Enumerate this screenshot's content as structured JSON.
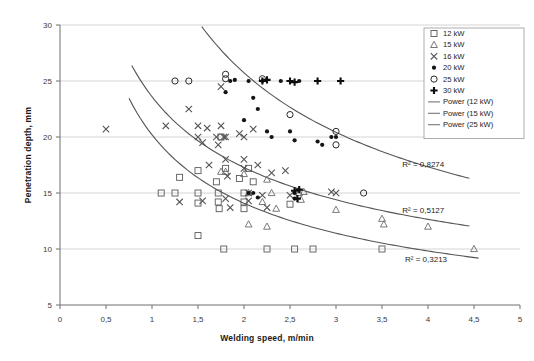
{
  "chart_data": {
    "type": "scatter",
    "title": "",
    "xlabel": "Welding speed, m/min",
    "ylabel": "Penetration depth, mm",
    "xlim": [
      0,
      5
    ],
    "ylim": [
      5,
      30
    ],
    "xticks": [
      "0",
      "0,5",
      "1",
      "1,5",
      "2",
      "2,5",
      "3",
      "3,5",
      "4",
      "4,5",
      "5"
    ],
    "xtick_values": [
      0,
      0.5,
      1,
      1.5,
      2,
      2.5,
      3,
      3.5,
      4,
      4.5,
      5
    ],
    "yticks": [
      "5",
      "10",
      "15",
      "20",
      "25",
      "30"
    ],
    "ytick_values": [
      5,
      10,
      15,
      20,
      25,
      30
    ],
    "grid": "horizontal-major",
    "decimal_separator": ",",
    "legend_position": "top-right",
    "legend": [
      {
        "label": "12 kW",
        "marker": "open-square"
      },
      {
        "label": "15 kW",
        "marker": "open-triangle"
      },
      {
        "label": "16 kW",
        "marker": "cross"
      },
      {
        "label": "20 kW",
        "marker": "filled-circle-small"
      },
      {
        "label": "25 kW",
        "marker": "open-circle"
      },
      {
        "label": "30 kW",
        "marker": "filled-plus"
      },
      {
        "label": "Power (12 kW)",
        "marker": "line"
      },
      {
        "label": "Power (15 kW)",
        "marker": "line"
      },
      {
        "label": "Power (25 kW)",
        "marker": "line"
      }
    ],
    "annotations": [
      {
        "text": "R² = 0,8274",
        "x": 3.72,
        "y": 17.3
      },
      {
        "text": "R² = 0,5127",
        "x": 3.72,
        "y": 13.2
      },
      {
        "text": "R² = 0,3213",
        "x": 3.75,
        "y": 8.8
      }
    ],
    "series": [
      {
        "name": "12 kW",
        "marker": "open-square",
        "points": [
          [
            1.1,
            15.0
          ],
          [
            1.25,
            15.0
          ],
          [
            1.3,
            16.4
          ],
          [
            1.5,
            15.0
          ],
          [
            1.5,
            14.1
          ],
          [
            1.5,
            17.0
          ],
          [
            1.5,
            11.2
          ],
          [
            1.7,
            16.0
          ],
          [
            1.72,
            15.0
          ],
          [
            1.72,
            14.2
          ],
          [
            1.73,
            13.6
          ],
          [
            1.75,
            20.0
          ],
          [
            1.78,
            10.0
          ],
          [
            1.8,
            17.2
          ],
          [
            1.95,
            16.3
          ],
          [
            2.0,
            15.0
          ],
          [
            2.0,
            14.2
          ],
          [
            2.0,
            13.6
          ],
          [
            2.05,
            17.2
          ],
          [
            2.1,
            16.0
          ],
          [
            2.25,
            10.0
          ],
          [
            2.5,
            14.0
          ],
          [
            2.55,
            10.0
          ],
          [
            2.75,
            10.0
          ],
          [
            3.5,
            10.0
          ]
        ]
      },
      {
        "name": "15 kW",
        "marker": "open-triangle",
        "points": [
          [
            1.75,
            16.9
          ],
          [
            1.8,
            16.9
          ],
          [
            2.0,
            16.7
          ],
          [
            2.05,
            15.0
          ],
          [
            2.2,
            14.2
          ],
          [
            2.25,
            16.2
          ],
          [
            2.3,
            15.0
          ],
          [
            2.35,
            13.6
          ],
          [
            2.6,
            15.0
          ],
          [
            2.62,
            14.4
          ],
          [
            2.65,
            15.1
          ],
          [
            3.0,
            13.5
          ],
          [
            3.5,
            12.7
          ],
          [
            3.52,
            12.2
          ],
          [
            4.0,
            12.0
          ],
          [
            4.5,
            10.0
          ],
          [
            2.05,
            12.2
          ],
          [
            2.25,
            12.0
          ]
        ]
      },
      {
        "name": "16 kW",
        "marker": "cross",
        "points": [
          [
            0.5,
            20.7
          ],
          [
            1.15,
            21.0
          ],
          [
            1.4,
            22.5
          ],
          [
            1.5,
            21.0
          ],
          [
            1.5,
            20.0
          ],
          [
            1.55,
            19.5
          ],
          [
            1.6,
            20.8
          ],
          [
            1.62,
            17.5
          ],
          [
            1.7,
            20.0
          ],
          [
            1.72,
            19.3
          ],
          [
            1.75,
            24.5
          ],
          [
            1.75,
            21.0
          ],
          [
            1.78,
            20.0
          ],
          [
            1.8,
            20.0
          ],
          [
            1.8,
            18.0
          ],
          [
            1.8,
            14.5
          ],
          [
            1.82,
            16.5
          ],
          [
            1.85,
            13.7
          ],
          [
            1.95,
            20.3
          ],
          [
            2.0,
            20.0
          ],
          [
            2.0,
            18.0
          ],
          [
            2.0,
            17.2
          ],
          [
            2.05,
            15.0
          ],
          [
            2.05,
            14.3
          ],
          [
            2.1,
            20.7
          ],
          [
            2.15,
            17.5
          ],
          [
            2.2,
            14.8
          ],
          [
            2.25,
            13.7
          ],
          [
            2.3,
            16.8
          ],
          [
            2.45,
            17.0
          ],
          [
            2.5,
            14.8
          ],
          [
            2.95,
            15.1
          ],
          [
            3.0,
            15.0
          ],
          [
            1.3,
            14.2
          ],
          [
            1.55,
            14.3
          ]
        ]
      },
      {
        "name": "20 kW",
        "marker": "filled-circle-small",
        "points": [
          [
            1.8,
            24.0
          ],
          [
            1.85,
            25.0
          ],
          [
            1.9,
            25.1
          ],
          [
            2.0,
            21.5
          ],
          [
            2.05,
            25.0
          ],
          [
            2.1,
            23.5
          ],
          [
            2.15,
            22.5
          ],
          [
            2.2,
            25.0
          ],
          [
            2.25,
            20.5
          ],
          [
            2.3,
            20.0
          ],
          [
            2.4,
            25.0
          ],
          [
            2.5,
            20.5
          ],
          [
            2.55,
            19.7
          ],
          [
            2.6,
            25.0
          ],
          [
            2.8,
            19.6
          ],
          [
            2.85,
            19.3
          ],
          [
            2.05,
            15.0
          ],
          [
            2.55,
            15.0
          ],
          [
            2.55,
            14.5
          ],
          [
            2.1,
            15.0
          ],
          [
            2.15,
            14.6
          ],
          [
            2.95,
            20.0
          ],
          [
            3.0,
            20.0
          ]
        ]
      },
      {
        "name": "25 kW",
        "marker": "open-circle",
        "points": [
          [
            1.25,
            25.0
          ],
          [
            1.4,
            25.0
          ],
          [
            1.8,
            25.2
          ],
          [
            1.8,
            25.6
          ],
          [
            2.2,
            25.2
          ],
          [
            2.5,
            22.0
          ],
          [
            3.0,
            20.5
          ],
          [
            3.0,
            19.3
          ],
          [
            3.3,
            15.0
          ]
        ]
      },
      {
        "name": "30 kW",
        "marker": "filled-plus",
        "points": [
          [
            2.2,
            25.0
          ],
          [
            2.25,
            25.1
          ],
          [
            2.5,
            25.0
          ],
          [
            2.55,
            24.9
          ],
          [
            2.8,
            25.0
          ],
          [
            3.05,
            25.0
          ],
          [
            2.55,
            15.2
          ],
          [
            2.6,
            15.3
          ],
          [
            2.58,
            14.5
          ]
        ]
      }
    ],
    "trendlines": [
      {
        "name": "Power (25 kW)",
        "r2": "0,8274",
        "a": 38.2,
        "b": -0.57,
        "x_start": 1.05,
        "x_end": 4.45
      },
      {
        "name": "Power (16 kW)",
        "r2": "0,5127",
        "a": 23.6,
        "b": -0.45,
        "x_start": 0.78,
        "x_end": 4.45
      },
      {
        "name": "Power (12 kW)",
        "r2": "0,3213",
        "a": 20.2,
        "b": -0.52,
        "x_start": 0.75,
        "x_end": 4.55
      }
    ]
  }
}
